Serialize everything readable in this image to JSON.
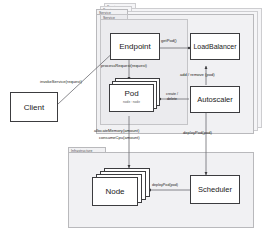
{
  "diagram": {
    "type": "uml-component-diagram",
    "packages": [
      {
        "id": "service-ghost-2",
        "label": "Service",
        "ghost": true
      },
      {
        "id": "service-ghost-1",
        "label": "Service",
        "ghost": true
      },
      {
        "id": "service",
        "label": "Service",
        "ghost": false
      },
      {
        "id": "infrastructure",
        "label": "Infrastructure",
        "ghost": false
      }
    ],
    "nodes": [
      {
        "id": "client",
        "label": "Client",
        "stacked": false,
        "package": null
      },
      {
        "id": "endpoint",
        "label": "Endpoint",
        "stacked": false,
        "package": "service"
      },
      {
        "id": "loadbalancer",
        "label": "LoadBalancer",
        "stacked": false,
        "package": "service"
      },
      {
        "id": "pod",
        "label": "Pod",
        "stacked": true,
        "package": "service",
        "attribute": "node : node"
      },
      {
        "id": "autoscaler",
        "label": "Autoscaler",
        "stacked": false,
        "package": "service"
      },
      {
        "id": "node",
        "label": "Node",
        "stacked": true,
        "package": "infrastructure"
      },
      {
        "id": "scheduler",
        "label": "Scheduler",
        "stacked": false,
        "package": "infrastructure"
      }
    ],
    "edges": [
      {
        "id": "client-endpoint",
        "from": "client",
        "to": "endpoint",
        "label": "invokeService(request)"
      },
      {
        "id": "endpoint-loadbalancer",
        "from": "endpoint",
        "to": "loadbalancer",
        "label": "getPod()"
      },
      {
        "id": "endpoint-pod",
        "from": "endpoint",
        "to": "pod",
        "label": "processRequest(request)"
      },
      {
        "id": "autoscaler-loadbalancer",
        "from": "autoscaler",
        "to": "loadbalancer",
        "label": "add / remove (pod)"
      },
      {
        "id": "autoscaler-pod",
        "from": "autoscaler",
        "to": "pod",
        "label": "create / delete"
      },
      {
        "id": "pod-node",
        "from": "pod",
        "to": "node",
        "label": "allocateMemory(amount)",
        "label2": "consumeCpu(amount)"
      },
      {
        "id": "autoscaler-scheduler",
        "from": "autoscaler",
        "to": "scheduler",
        "label": "deployPod(pod)"
      },
      {
        "id": "scheduler-node",
        "from": "scheduler",
        "to": "node",
        "label": "deployPod(pod)"
      }
    ],
    "colors": {
      "package_fill": "#f1f1f3",
      "package_border": "#b9b9bc",
      "box_fill": "#ffffff",
      "box_border": "#3c3c3f",
      "wire": "#6b6b70",
      "text": "#1a1a1a"
    }
  }
}
